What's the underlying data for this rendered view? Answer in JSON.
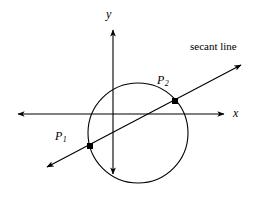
{
  "figure": {
    "background_color": "#ffffff",
    "stroke_color": "#000000",
    "width": 258,
    "height": 203
  },
  "axes": {
    "x_axis": {
      "label": "x",
      "icon": "x-axis-arrow-both",
      "y": 114,
      "x_start": 14,
      "x_end": 228,
      "arrow_left": true,
      "arrow_right": true
    },
    "y_axis": {
      "label": "y",
      "icon": "y-axis-arrow-both",
      "x": 113,
      "y_start": 26,
      "y_end": 178,
      "arrow_top": true,
      "arrow_bottom": true
    },
    "origin": {
      "x": 113,
      "y": 114
    }
  },
  "circle": {
    "name": "circle",
    "center_x": 138,
    "center_y": 133,
    "radius": 50,
    "stroke_width": 1.1,
    "fill": "none"
  },
  "secant": {
    "label": "secant line",
    "x1": 42,
    "y1": 170,
    "x2": 246,
    "y2": 62,
    "arrow_start": true,
    "arrow_end": true,
    "stroke_width": 1.1
  },
  "points": [
    {
      "id": "P1",
      "label": "P",
      "subscript": "1",
      "x": 90,
      "y": 146,
      "marker": "filled-square",
      "marker_size": 6
    },
    {
      "id": "P2",
      "label": "P",
      "subscript": "2",
      "x": 175,
      "y": 101,
      "marker": "filled-square",
      "marker_size": 6
    }
  ]
}
